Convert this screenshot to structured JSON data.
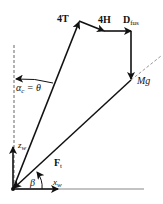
{
  "diagram": {
    "labels": {
      "thrust": "4T",
      "h_force": "4H",
      "drag_main": "D",
      "drag_sub": "fus",
      "weight": "Mg",
      "resultant_main": "F",
      "resultant_sub": "t",
      "angle_alpha": "α",
      "angle_alpha_sub": "c",
      "angle_alpha_eq": "= θ",
      "z_axis": "z",
      "z_axis_sub": "w",
      "x_axis": "x",
      "x_axis_sub": "w",
      "angle_beta": "β"
    },
    "colors": {
      "stroke": "#111111",
      "dashed": "#777777",
      "background": "#ffffff"
    }
  }
}
